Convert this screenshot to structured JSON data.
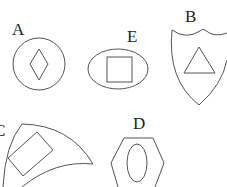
{
  "figure": {
    "shapes": [
      {
        "label": "A",
        "outer": "circle",
        "inner": "diamond"
      },
      {
        "label": "E",
        "outer": "ellipse",
        "inner": "square"
      },
      {
        "label": "B",
        "outer": "shield",
        "inner": "triangle"
      },
      {
        "label": "C",
        "outer": "curved-fan",
        "inner": "rectangle"
      },
      {
        "label": "D",
        "outer": "hexagon",
        "inner": "ellipse"
      }
    ],
    "colors": {
      "stroke": "#555555",
      "text": "#222222",
      "background": "#ffffff"
    }
  }
}
